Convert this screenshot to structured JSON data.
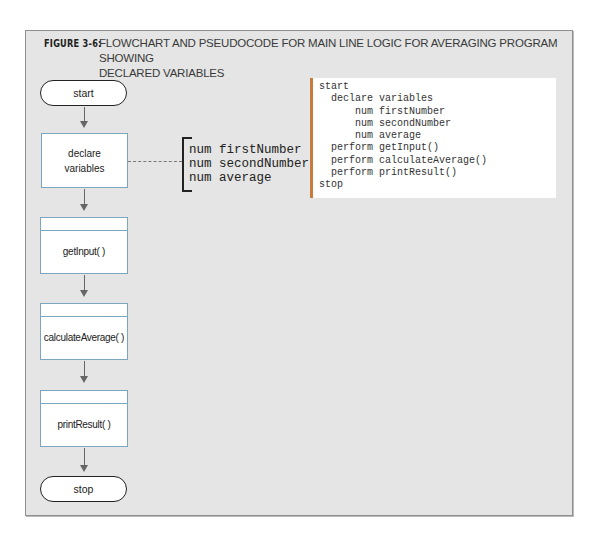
{
  "figure": {
    "label": "FIGURE 3-6:",
    "caption_line1": "FLOWCHART AND PSEUDOCODE FOR MAIN LINE LOGIC FOR AVERAGING PROGRAM SHOWING",
    "caption_line2": "DECLARED VARIABLES"
  },
  "flowchart": {
    "start": "start",
    "declare_line1": "declare",
    "declare_line2": "variables",
    "modules": [
      "getInput( )",
      "calculateAverage( )",
      "printResult( )"
    ],
    "stop": "stop"
  },
  "variables_annotation": [
    "num firstNumber",
    "num secondNumber",
    "num average"
  ],
  "pseudocode": [
    "start",
    "  declare variables",
    "      num firstNumber",
    "      num secondNumber",
    "      num average",
    "  perform getInput()",
    "  perform calculateAverage()",
    "  perform printResult()",
    "stop"
  ],
  "colors": {
    "background": "#e4e5e4",
    "process_border": "#7aa6bf",
    "code_accent": "#c97b3b"
  }
}
